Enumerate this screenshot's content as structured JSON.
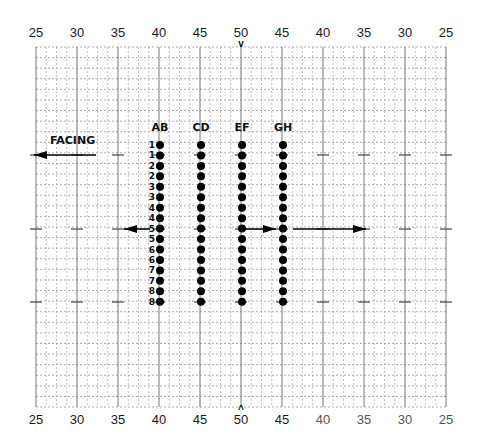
{
  "diagram": {
    "type": "marching-band drill chart",
    "grid": {
      "left": 36,
      "right": 446,
      "top": 47,
      "bottom": 407,
      "cols": 40,
      "rows": 34
    },
    "yard_lines_top": [
      "25",
      "30",
      "35",
      "40",
      "45",
      "50",
      "45",
      "40",
      "35",
      "30",
      "25"
    ],
    "yard_lines_bottom": [
      "25",
      "30",
      "35",
      "40",
      "45",
      "50",
      "45",
      "40",
      "35",
      "30",
      "25"
    ],
    "center_marker_top": "v",
    "center_marker_bottom": "^",
    "facing_label": "FACING",
    "facing_direction": "left",
    "columns": [
      {
        "label": "AB",
        "x": 160
      },
      {
        "label": "CD",
        "x": 201
      },
      {
        "label": "EF",
        "x": 242
      },
      {
        "label": "GH",
        "x": 283
      }
    ],
    "row_labels": [
      "1",
      "1",
      "2",
      "2",
      "3",
      "3",
      "4",
      "4",
      "5",
      "5",
      "6",
      "6",
      "7",
      "7",
      "8",
      "8"
    ],
    "dot_rows_y_start": 145,
    "dot_row_spacing": 10.45,
    "arrows": [
      {
        "name": "facing-arrow",
        "from": [
          96,
          155
        ],
        "to": [
          34,
          155
        ],
        "direction": "left"
      },
      {
        "name": "ab-move-arrow",
        "from": [
          150,
          229
        ],
        "to": [
          124,
          229
        ],
        "direction": "left"
      },
      {
        "name": "ef-move-arrow",
        "from": [
          244,
          229
        ],
        "to": [
          276,
          229
        ],
        "direction": "right"
      },
      {
        "name": "gh-move-arrow",
        "from": [
          293,
          229
        ],
        "to": [
          366,
          229
        ],
        "direction": "right"
      }
    ],
    "hash_rows_y": [
      155,
      229,
      302
    ]
  }
}
